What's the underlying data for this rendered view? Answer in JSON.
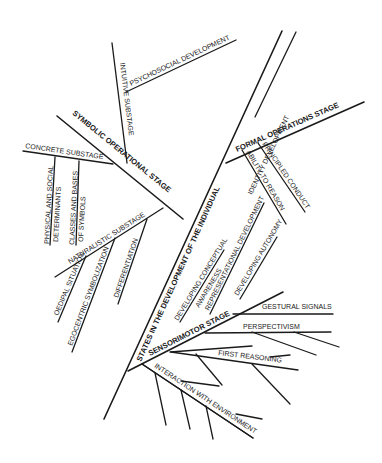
{
  "diagram": {
    "type": "tree",
    "root": "STATES IN THE DEVELOPMENT OF THE INDIVIDUAL",
    "labels": {
      "trunk": "STATES IN THE DEVELOPMENT OF THE INDIVIDUAL",
      "symbolic_stage": "SYMBOLIC OPERATIONAL STAGE",
      "intuitive_substage": "INTUITIVE SUBSTAGE",
      "psychosocial": "PSYCHOSOCIAL DEVELOPMENT",
      "concrete_substage": "CONCRETE SUBSTAGE",
      "physical_social_1": "PHYSICAL AND SOCIAL",
      "physical_social_2": "DETERMINANTS",
      "classes_bases_1": "CLASSES AND BASES",
      "classes_bases_2": "OF SYMBOLS",
      "naturalistic_substage": "NATURALISTIC SUBSTAGE",
      "oedipal": "OEDIPAL SITUATION",
      "egocentric": "EGOCENTRIC SYMBOLIZATION",
      "differentiation": "DIFFERENTIATION",
      "formal_stage": "FORMAL OPERATIONS STAGE",
      "identity": "IDENTITY DEVELOPMENT",
      "principled": "PRINCIPLED CONDUCT",
      "ability": "ABILITY TO REASON",
      "conceptual_1": "DEVELOPING CONCEPTUAL",
      "conceptual_2": "AWARENESS",
      "representational": "REPRESENTATIONAL DEVELOPMENT",
      "autonomy": "DEVELOPING AUTONOMY",
      "sensorimotor_stage": "SENSORIMOTOR STAGE",
      "gestural": "GESTURAL SIGNALS",
      "perspectivism": "PERSPECTIVISM",
      "first_reasoning": "FIRST REASONING",
      "interaction": "INTERACTION WITH ENVIRONMENT"
    },
    "structure": [
      {
        "stage": "SENSORIMOTOR STAGE",
        "children": [
          "GESTURAL SIGNALS",
          "PERSPECTIVISM",
          "FIRST REASONING",
          "INTERACTION WITH ENVIRONMENT"
        ]
      },
      {
        "stage": "SYMBOLIC OPERATIONAL STAGE",
        "children": [
          {
            "substage": "NATURALISTIC SUBSTAGE",
            "children": [
              "OEDIPAL SITUATION",
              "EGOCENTRIC SYMBOLIZATION",
              "DIFFERENTIATION"
            ]
          },
          {
            "substage": "CONCRETE SUBSTAGE",
            "children": [
              "PHYSICAL AND SOCIAL DETERMINANTS",
              "CLASSES AND BASES OF SYMBOLS"
            ]
          },
          {
            "substage": "INTUITIVE SUBSTAGE",
            "children": [
              "PSYCHOSOCIAL DEVELOPMENT"
            ]
          }
        ]
      },
      {
        "stage": "FORMAL OPERATIONS STAGE",
        "children": [
          "IDENTITY DEVELOPMENT",
          "PRINCIPLED CONDUCT",
          "ABILITY TO REASON"
        ]
      },
      {
        "unattached": [
          "DEVELOPING CONCEPTUAL AWARENESS",
          "REPRESENTATIONAL DEVELOPMENT",
          "DEVELOPING AUTONOMY"
        ]
      }
    ],
    "colors": {
      "ink": "#1a1a1a",
      "background": "#ffffff"
    }
  }
}
